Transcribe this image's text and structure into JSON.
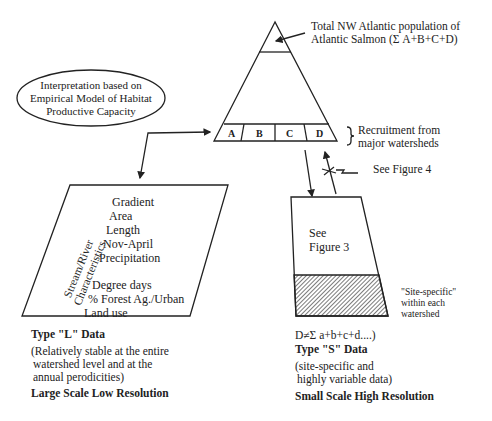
{
  "pyramid": {
    "top_label_line1": "Total NW Atlantic population of",
    "top_label_line2": "Atlantic Salmon (Σ A+B+C+D)",
    "segments": [
      "A",
      "B",
      "C",
      "D"
    ],
    "recruitment_label_line1": "Recruitment from",
    "recruitment_label_line2": "major watersheds",
    "see_figure_4": "See Figure 4"
  },
  "ellipse": {
    "line1": "Interpretation based on",
    "line2": "Empirical Model of Habitat",
    "line3": "Productive Capacity"
  },
  "left_box": {
    "side_label_line1": "Stream/River",
    "side_label_line2": "Characteristics",
    "items": [
      "Gradient",
      "Area",
      "Length",
      "Nov-April",
      "Precipitation",
      "Degree days",
      "% Forest Ag./Urban",
      "Land use"
    ]
  },
  "left_caption": {
    "type": "Type \"L\" Data",
    "desc_line1": "(Relatively stable at the entire",
    "desc_line2": "watershed level and at the",
    "desc_line3": "annual perodicities)",
    "scale": "Large Scale Low Resolution"
  },
  "right_box": {
    "see_line1": "See",
    "see_line2": "Figure 3",
    "site_label_line1": "\"Site-specific\"",
    "site_label_line2": "within each",
    "site_label_line3": "watershed"
  },
  "right_caption": {
    "formula": "D≠Σ a+b+c+d....)",
    "type": "Type \"S\" Data",
    "desc_line1": "(site-specific and",
    "desc_line2": "highly variable data)",
    "scale": "Small Scale High Resolution"
  },
  "colors": {
    "ink": "#222222",
    "background": "#ffffff"
  }
}
